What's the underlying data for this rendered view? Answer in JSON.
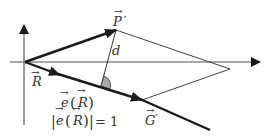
{
  "diagram": {
    "type": "vector-geometry",
    "colors": {
      "axis": "#777777",
      "thick_vector": "#1a1a1a",
      "thin_line": "#444444",
      "angle_fill": "#aaaaaa",
      "text": "#333333"
    },
    "labels": {
      "p_prime": "P",
      "p_prime_prime_mark": "′",
      "d": "d",
      "r": "R",
      "g_prime": "G",
      "g_prime_prime_mark": "′",
      "e_of_r_e": "e",
      "e_of_r_open": "(",
      "e_of_r_r": "R",
      "e_of_r_close": ")",
      "norm_bar_left": "|",
      "norm_e": "e",
      "norm_open": "(",
      "norm_r": "R",
      "norm_close": ")",
      "norm_bar_right": "|",
      "norm_equals": "= 1"
    },
    "arrow_glyph": "→"
  }
}
